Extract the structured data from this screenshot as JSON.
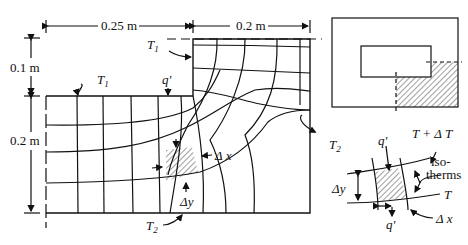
{
  "figure": {
    "colors": {
      "ink": "#111111",
      "background": "#ffffff"
    }
  },
  "dimensions": {
    "width_left": "0.25 m",
    "width_right": "0.2 m",
    "height_top": "0.1 m",
    "height_bottom": "0.2 m"
  },
  "labels": {
    "T1_top": "T",
    "T1_top_sub": "1",
    "T1_left": "T",
    "T1_left_sub": "1",
    "q_prime_main": "q'",
    "T2_right": "T",
    "T2_right_sub": "2",
    "T2_bottom": "T",
    "T2_bottom_sub": "2",
    "delta_x_main": "Δ x",
    "delta_y_main": "Δy"
  },
  "detail": {
    "q_top": "q'",
    "q_bottom": "q'",
    "T_plus_dT": "T + Δ T",
    "iso_line1": "iso-",
    "iso_line2": "therms",
    "T": "T",
    "delta_y": "Δy",
    "delta_x": "Δ x"
  }
}
